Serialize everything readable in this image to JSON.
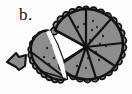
{
  "figure": {
    "panel_label": "b.",
    "caption_text": "",
    "background_color": "#fdfdfd",
    "ink_color": "#111111",
    "fill_color": "#8d8d8d",
    "fill_color_light": "#9a9a9a",
    "fill_color_dark": "#7d7d7d",
    "speckle_color": "#1a1a1a"
  },
  "objects": {
    "arrow_marker": {
      "name": "left-pointing arrow marker",
      "direction": "left",
      "center_x": 16,
      "center_y": 62,
      "width": 20,
      "height": 17,
      "fill": "#8d8d8d"
    },
    "main_disc": {
      "name": "large sectioned disc with beaded rim",
      "center_x": 86,
      "center_y": 48,
      "radius": 37,
      "bead_count": 30,
      "bead_radius": 3.4,
      "sector_count": 7,
      "sector_angles_deg": [
        188,
        232,
        276,
        312,
        348,
        26,
        68,
        110
      ],
      "speckle_count": 17
    },
    "broken_wedge": {
      "name": "detached wedge fragment with beaded rim",
      "apex_x": 69,
      "apex_y": 77,
      "radius": 34,
      "bead_count": 13,
      "bead_radius": 3.2,
      "sector_count": 2,
      "speckle_count": 5
    },
    "fracture_gap": {
      "name": "white fracture gap between fragment and disc",
      "visible": true
    }
  },
  "speckles": {
    "main_disc": [
      [
        78,
        27
      ],
      [
        84,
        24
      ],
      [
        92,
        30
      ],
      [
        97,
        27
      ],
      [
        103,
        36
      ],
      [
        100,
        44
      ],
      [
        96,
        52
      ],
      [
        88,
        58
      ],
      [
        82,
        60
      ],
      [
        79,
        52
      ],
      [
        74,
        40
      ],
      [
        90,
        40
      ],
      [
        99,
        60
      ],
      [
        86,
        68
      ],
      [
        77,
        66
      ],
      [
        106,
        46
      ],
      [
        93,
        21
      ]
    ],
    "broken_wedge": [
      [
        47,
        48
      ],
      [
        52,
        45
      ],
      [
        44,
        56
      ],
      [
        55,
        57
      ],
      [
        50,
        63
      ]
    ]
  }
}
